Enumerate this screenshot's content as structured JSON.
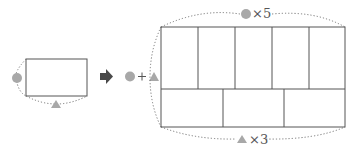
{
  "colors": {
    "circle": "#a8a8a8",
    "triangle": "#a8a8a8",
    "line": "#555555",
    "dotted": "#777777",
    "arrow": "#4a4a4a"
  },
  "small_figure": {
    "circle_symbol": "circle",
    "triangle_symbol": "triangle"
  },
  "operator": {
    "left_symbol": "circle",
    "plus": "+",
    "right_symbol": "triangle"
  },
  "big_figure": {
    "top_label": "×5",
    "bottom_label": "×3",
    "top_row_cells": 5,
    "bottom_row_cells": 3
  }
}
